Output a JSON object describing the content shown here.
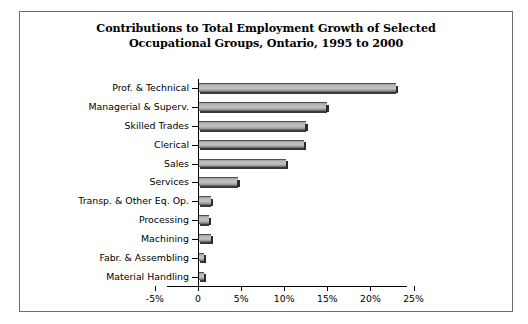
{
  "figure": {
    "title_line1": "Contributions to Total Employment Growth of Selected",
    "title_line2": "Occupational Groups, Ontario, 1995 to 2000",
    "frame_color": "#6e6e6e",
    "bar_color": "#bdbdbd",
    "axis_color": "#000000"
  },
  "chart_data": {
    "type": "bar",
    "orientation": "horizontal",
    "title": "Contributions to Total Employment Growth of Selected Occupational Groups, Ontario, 1995 to 2000",
    "xlabel": "",
    "ylabel": "",
    "categories": [
      "Prof. & Technical",
      "Managerial & Superv.",
      "Skilled Trades",
      "Clerical",
      "Sales",
      "Services",
      "Transp. & Other Eq. Op.",
      "Processing",
      "Machining",
      "Fabr. & Assembling",
      "Material Handling"
    ],
    "values": [
      22.9,
      14.8,
      12.4,
      12.2,
      10.1,
      4.5,
      1.4,
      1.2,
      1.4,
      0.6,
      0.6
    ],
    "value_unit": "%",
    "xlim": [
      -5,
      26
    ],
    "xticks": [
      -5,
      0,
      5,
      10,
      15,
      20,
      25
    ],
    "xtick_labels": [
      "-5%",
      "0",
      "5%",
      "10%",
      "15%",
      "20%",
      "25%"
    ],
    "grid": false,
    "legend": null
  }
}
